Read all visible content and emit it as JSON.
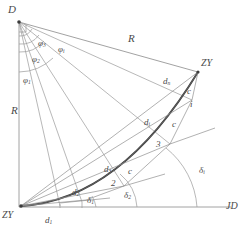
{
  "figure": {
    "stroke_color": "#7d7d7d",
    "curve_color": "#3c3c3c",
    "label_color": "#4a4a4a",
    "background": "#ffffff",
    "width": 248,
    "height": 236
  },
  "points": {
    "d_label": "D",
    "zy_top_label": "ZY",
    "zy_bottom_label": "ZY",
    "jd_label": "JD"
  },
  "radii": {
    "r_top_label": "R",
    "r_left_label": "R"
  },
  "phi_angles": [
    {
      "label": "φ",
      "sub": "3"
    },
    {
      "label": "φ",
      "sub": "i"
    },
    {
      "label": "φ",
      "sub": "2"
    },
    {
      "label": "φ",
      "sub": "1"
    }
  ],
  "phi_plain": {
    "phi3": "φ",
    "phi3_sub": "3",
    "phii": "φ",
    "phii_sub": "i",
    "phi2": "φ",
    "phi2_sub": "2",
    "phi1": "φ",
    "phi1_sub": "1"
  },
  "distances": {
    "dn": "d",
    "dn_sub": "n",
    "di": "d",
    "di_sub": "i",
    "d3": "d",
    "d3_sub": "3",
    "d2": "d",
    "d2_sub": "2",
    "d1": "d",
    "d1_sub": "1"
  },
  "chords": {
    "c_top": "c",
    "c_mid": "c",
    "c_low": "c"
  },
  "station_numbers": {
    "i": "i",
    "three": "3",
    "two": "2"
  },
  "delta_angles": {
    "delta_i": "δ",
    "delta_i_sub": "i",
    "delta_2": "δ",
    "delta_2_sub": "2",
    "delta_1": "δ",
    "delta_1_sub": "1"
  },
  "bleed_text": {
    "line1": "",
    "line2": "",
    "line3": ""
  }
}
